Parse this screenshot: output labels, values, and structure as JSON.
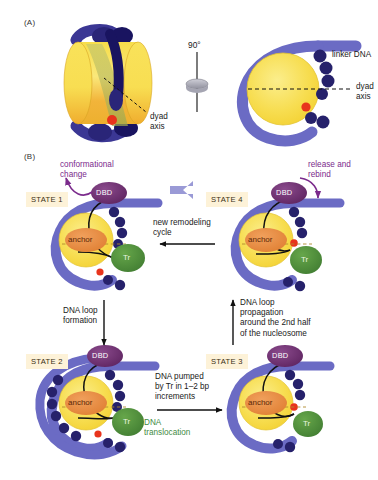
{
  "figure": {
    "panels": [
      {
        "tag": "(A)",
        "name": "nucleosome-structure"
      },
      {
        "tag": "(B)",
        "name": "remodeling-cycle"
      }
    ]
  },
  "panel_a": {
    "tag": "(A)",
    "rotation_label": "90°",
    "linker_dna_label": "linker DNA",
    "dyad_axis_label_left": "dyad\naxis",
    "dyad_axis_label_right": "dyad\naxis"
  },
  "panel_b": {
    "tag": "(B)",
    "states": [
      {
        "id": "state1",
        "label": "STATE 1",
        "dbd_label": "DBD",
        "anchor_label": "anchor",
        "tr_label": "Tr"
      },
      {
        "id": "state4",
        "label": "STATE 4",
        "dbd_label": "DBD",
        "anchor_label": "anchor",
        "tr_label": "Tr"
      },
      {
        "id": "state2",
        "label": "STATE 2",
        "dbd_label": "DBD",
        "anchor_label": "anchor",
        "tr_label": "Tr"
      },
      {
        "id": "state3",
        "label": "STATE 3",
        "dbd_label": "DBD",
        "anchor_label": "anchor",
        "tr_label": "Tr"
      }
    ],
    "annotations": {
      "conformational_change": "conformational\nchange",
      "release_and_rebind": "release and\nrebind",
      "new_remodeling_cycle": "new remodeling\ncycle",
      "dna_loop_formation": "DNA loop\nformation",
      "dna_loop_propagation": "DNA loop\npropagation\naround the 2nd half\nof the nucleosome",
      "dna_pumped": "DNA pumped\nby Tr in 1–2 bp\nincrements",
      "dna_translocation": "DNA\ntranslocation"
    }
  },
  "colors": {
    "dna_purple": "#6b6bc4",
    "histone_dot": "#26216b",
    "core_yellow": "#f5d63c",
    "core_yellow_light": "#fae87a",
    "anchor_orange": "#e8883a",
    "dbd_purple": "#6d2d6e",
    "tr_green": "#4f8f3a",
    "red_dot": "#e8341c",
    "badge_bg": "#fdf2d8",
    "annotation_purple": "#7b2b8c",
    "annotation_green": "#3f8a3f",
    "arrow_lilac": "#9a9ad6"
  }
}
